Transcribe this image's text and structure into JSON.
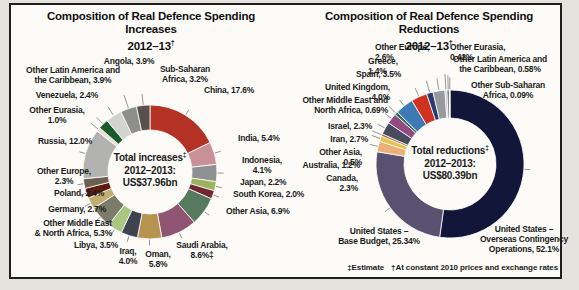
{
  "page": {
    "footnote_estimate": "‡Estimate",
    "footnote_constant": "†At constant 2010 prices and exchange rates"
  },
  "chart_data": [
    {
      "type": "pie",
      "subtype": "donut",
      "title": "Composition of Real Defence Spending Increases",
      "subtitle": "2012–13",
      "subtitle_dagger": "†",
      "legend": "labels around donut with leader lines",
      "direction": "clockwise",
      "start_angle_deg": 0,
      "center": {
        "line1": "Total increases",
        "line1_sup": "‡",
        "line2": "2012–2013:",
        "line3": "US$37.96bn"
      },
      "total_value": "US$37.96bn",
      "unit": "percent share of total real increases",
      "segments": [
        {
          "label": "China",
          "value": 17.6,
          "display": "China, 17.6%",
          "color": "#b43125"
        },
        {
          "label": "India",
          "value": 5.4,
          "display": "India, 5.4%",
          "color": "#c99097"
        },
        {
          "label": "Indonesia",
          "value": 4.1,
          "display": "Indonesia,\n4.1%",
          "color": "#8f9091"
        },
        {
          "label": "Japan",
          "value": 2.2,
          "display": "Japan, 2.2%",
          "color": "#9cb25c"
        },
        {
          "label": "South Korea",
          "value": 2.0,
          "display": "South Korea, 2.0%",
          "color": "#722832"
        },
        {
          "label": "Other Asia",
          "value": 6.9,
          "display": "Other Asia, 6.9%",
          "color": "#567a5e"
        },
        {
          "label": "Saudi Arabia",
          "value": 8.6,
          "display": "Saudi Arabia,\n8.6%‡",
          "color": "#8e5472"
        },
        {
          "label": "Oman",
          "value": 5.8,
          "display": "Oman,\n5.8%",
          "color": "#b6934f"
        },
        {
          "label": "Iraq",
          "value": 4.0,
          "display": "Iraq,\n4.0%",
          "color": "#3f4350"
        },
        {
          "label": "Libya",
          "value": 3.5,
          "display": "Libya, 3.5%",
          "color": "#a9c682"
        },
        {
          "label": "Other Middle East & North Africa",
          "value": 5.3,
          "display": "Other Middle East\n& North Africa, 5.3%",
          "color": "#7b7c6a"
        },
        {
          "label": "Germany",
          "value": 2.7,
          "display": "Germany, 2.7%",
          "color": "#c3ad6d"
        },
        {
          "label": "Poland",
          "value": 2.4,
          "display": "Poland, 2.4%",
          "color": "#5e1b10"
        },
        {
          "label": "Other Europe",
          "value": 2.3,
          "display": "Other Europe,\n2.3%",
          "color": "#6a6251"
        },
        {
          "label": "Russia",
          "value": 12.0,
          "display": "Russia, 12.0%",
          "color": "#b2b3b1"
        },
        {
          "label": "Other Eurasia",
          "value": 1.0,
          "display": "Other Eurasia,\n1.0%",
          "color": "#e8e1cf"
        },
        {
          "label": "Venezuela",
          "value": 2.4,
          "display": "Venezuela, 2.4%",
          "color": "#1b5a2b"
        },
        {
          "label": "Other Latin America and the Caribbean",
          "value": 3.9,
          "display": "Other Latin America and\nthe Caribbean, 3.9%",
          "color": "#d2d2d0"
        },
        {
          "label": "Angola",
          "value": 3.9,
          "display": "Angola, 3.9%",
          "color": "#8e8e8c"
        },
        {
          "label": "Sub-Saharan Africa",
          "value": 3.2,
          "display": "Sub-Saharan\nAfrica, 3.2%",
          "color": "#57504c"
        }
      ]
    },
    {
      "type": "pie",
      "subtype": "donut",
      "title": "Composition of Real Defence Spending Reductions",
      "subtitle": "2012–13",
      "subtitle_dagger": "†",
      "legend": "labels around donut with leader lines",
      "direction": "clockwise",
      "start_angle_deg": 0,
      "center": {
        "line1": "Total reductions",
        "line1_sup": "‡",
        "line2": "2012–2013:",
        "line3": "US$80.39bn"
      },
      "total_value": "US$80.39bn",
      "unit": "percent share of total real reductions",
      "segments": [
        {
          "label": "United States – Overseas Contingency Operations",
          "value": 52.1,
          "display": "United States –\nOverseas Contingency\nOperations, 52.1%",
          "color": "#12173a"
        },
        {
          "label": "United States – Base Budget",
          "value": 25.34,
          "display": "United States –\nBase Budget, 25.34%",
          "color": "#585270"
        },
        {
          "label": "Canada",
          "value": 2.3,
          "display": "Canada, 2.3%",
          "color": "#e9b175"
        },
        {
          "label": "Australia",
          "value": 1.2,
          "display": "Australia, 1.2%",
          "color": "#e5c34e"
        },
        {
          "label": "Other Asia",
          "value": 0.5,
          "display": "Other Asia, 0.5%",
          "color": "#a4632f"
        },
        {
          "label": "Iran",
          "value": 2.7,
          "display": "Iran, 2.7%",
          "color": "#474b5e"
        },
        {
          "label": "Israel",
          "value": 2.3,
          "display": "Israel, 2.3%",
          "color": "#924b80"
        },
        {
          "label": "Other Middle East and North Africa",
          "value": 0.69,
          "display": "Other Middle East and\nNorth Africa, 0.69%",
          "color": "#2f6a55"
        },
        {
          "label": "United Kingdom",
          "value": 4.0,
          "display": "United Kingdom, 4.0%",
          "color": "#3d79b2"
        },
        {
          "label": "Spain",
          "value": 3.5,
          "display": "Spain, 3.5%",
          "color": "#cf3220"
        },
        {
          "label": "Greece",
          "value": 1.4,
          "display": "Greece, 1.4%",
          "color": "#2a3a72"
        },
        {
          "label": "Other Europe",
          "value": 2.6,
          "display": "Other Europe, 2.6%",
          "color": "#97999c"
        },
        {
          "label": "Other Eurasia",
          "value": 0.42,
          "display": "Other Eurasia, 0.42%",
          "color": "#b5b6b8"
        },
        {
          "label": "Other Latin America and the Caribbean",
          "value": 0.58,
          "display": "Other Latin America and\nthe Caribbean, 0.58%",
          "color": "#84868a"
        },
        {
          "label": "Other Sub-Saharan Africa",
          "value": 0.09,
          "display": "Other Sub-Saharan\nAfrica, 0.09%",
          "color": "#d8d8d6"
        }
      ]
    }
  ]
}
